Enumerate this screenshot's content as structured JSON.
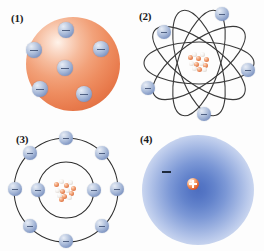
{
  "figure": {
    "background_color": "#fdfdfd",
    "panel_count": 4
  },
  "colors": {
    "sphere_orange": "#ee8d60",
    "sphere_highlight": "#fff3ea",
    "electron_blue": "#8298c4",
    "electron_highlight": "#e8edf6",
    "minus_sign": "#3d4f72",
    "orbit_line": "#3a3a3a",
    "shell_line": "#2e2e2e",
    "cloud_blue": "#4e6fc0",
    "nucleus_proton": "#de7343",
    "nucleus_neutron": "#f4f1ee",
    "label_text": "#1b1b1b"
  },
  "panels": [
    {
      "id": "panel-1",
      "label": "(1)",
      "model_name": "plum-pudding-model",
      "electron_count": 6,
      "nucleus": false,
      "electrons": [
        {
          "x": 66,
          "y": 30,
          "r": 8
        },
        {
          "x": 34,
          "y": 50,
          "r": 8
        },
        {
          "x": 101,
          "y": 49,
          "r": 8
        },
        {
          "x": 65,
          "y": 68,
          "r": 8
        },
        {
          "x": 40,
          "y": 89,
          "r": 8
        },
        {
          "x": 84,
          "y": 94,
          "r": 8
        }
      ]
    },
    {
      "id": "panel-2",
      "label": "(2)",
      "model_name": "rutherford-orbital-model",
      "electron_count": 6,
      "nucleus": true,
      "orbit_count": 5,
      "orbits": [
        {
          "rx": 52,
          "ry": 20,
          "rotate": 0
        },
        {
          "rx": 52,
          "ry": 20,
          "rotate": 36
        },
        {
          "rx": 52,
          "ry": 20,
          "rotate": 72
        },
        {
          "rx": 52,
          "ry": 20,
          "rotate": 108
        },
        {
          "rx": 52,
          "ry": 20,
          "rotate": 144
        }
      ],
      "electrons": [
        {
          "x": 90,
          "y": 14,
          "r": 7
        },
        {
          "x": 32,
          "y": 32,
          "r": 7
        },
        {
          "x": 116,
          "y": 70,
          "r": 7
        },
        {
          "x": 16,
          "y": 88,
          "r": 7
        },
        {
          "x": 72,
          "y": 114,
          "r": 7
        }
      ]
    },
    {
      "id": "panel-3",
      "label": "(3)",
      "model_name": "bohr-shell-model",
      "nucleus": true,
      "shells": [
        {
          "name": "inner-shell",
          "r": 28,
          "electron_count": 2
        },
        {
          "name": "outer-shell",
          "r": 52,
          "electron_count": 8
        }
      ],
      "electron_count": 10
    },
    {
      "id": "panel-4",
      "label": "(4)",
      "model_name": "quantum-electron-cloud-model",
      "nucleus": true,
      "nucleus_charge": "+",
      "electron_marker": "−",
      "electron_count": 1
    }
  ]
}
